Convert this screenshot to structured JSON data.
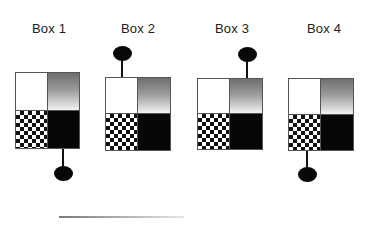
{
  "diagram": {
    "boxes": [
      {
        "label": "Box 1",
        "knob_position": "bottom",
        "knob_attached_quadrant": "bottom-right"
      },
      {
        "label": "Box 2",
        "knob_position": "top",
        "knob_attached_quadrant": "top-left"
      },
      {
        "label": "Box 3",
        "knob_position": "top",
        "knob_attached_quadrant": "top-right"
      },
      {
        "label": "Box 4",
        "knob_position": "bottom",
        "knob_attached_quadrant": "bottom-left"
      }
    ],
    "quadrant_fills": {
      "top_left": "white",
      "top_right": "gray-gradient",
      "bottom_left": "checkerboard",
      "bottom_right": "black"
    },
    "colors": {
      "border": "#555555",
      "knob": "#080808",
      "black_fill": "#060606",
      "gradient_top": "#6f6f6f",
      "gradient_bottom": "#f2f2f2"
    }
  }
}
